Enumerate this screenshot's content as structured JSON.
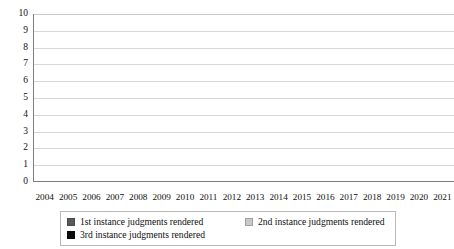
{
  "chart_data": {
    "type": "bar",
    "stacked": true,
    "title": "",
    "subtitle": "",
    "xlabel": "",
    "ylabel": "",
    "categories": [
      "2004",
      "2005",
      "2006",
      "2007",
      "2008",
      "2009",
      "2010",
      "2011",
      "2012",
      "2013",
      "2014",
      "2015",
      "2016",
      "2017",
      "2018",
      "2019",
      "2020",
      "2021"
    ],
    "series": [
      {
        "name": "1st instance judgments rendered",
        "color": "#595959",
        "values": [
          0,
          2,
          1,
          1,
          4,
          3,
          1,
          1,
          0,
          1,
          2,
          2,
          1,
          1,
          0,
          0,
          2,
          0
        ]
      },
      {
        "name": "2nd instance judgments rendered",
        "color": "#c7c7c7",
        "values": [
          0,
          0,
          0,
          0,
          0,
          0,
          1,
          1,
          0,
          0,
          1,
          0,
          1,
          0,
          0,
          1,
          1,
          0
        ]
      },
      {
        "name": "3rd instance judgments rendered",
        "color": "#0d0d0d",
        "values": [
          0,
          0,
          0,
          0,
          0,
          0,
          0,
          0,
          0,
          0,
          0,
          1,
          0,
          0,
          0,
          1,
          1,
          0
        ]
      }
    ],
    "totals": [
      0,
      2,
      1,
      1,
      4,
      3,
      2,
      2,
      0,
      1,
      3,
      3,
      2,
      1,
      0,
      2,
      4,
      0
    ],
    "ylim": [
      0,
      10
    ],
    "y_ticks": [
      "0",
      "1",
      "2",
      "3",
      "4",
      "5",
      "6",
      "7",
      "8",
      "9",
      "10"
    ],
    "grid": true,
    "legend_position": "bottom"
  },
  "axes": {
    "y_tick_labels": [
      "0",
      "1",
      "2",
      "3",
      "4",
      "5",
      "6",
      "7",
      "8",
      "9",
      "10"
    ],
    "x_tick_labels": [
      "2004",
      "2005",
      "2006",
      "2007",
      "2008",
      "2009",
      "2010",
      "2011",
      "2012",
      "2013",
      "2014",
      "2015",
      "2016",
      "2017",
      "2018",
      "2019",
      "2020",
      "2021"
    ]
  },
  "legend": {
    "items": [
      {
        "label": "1st instance judgments rendered",
        "color": "#595959"
      },
      {
        "label": "2nd instance judgments rendered",
        "color": "#c7c7c7"
      },
      {
        "label": "3rd instance judgments rendered",
        "color": "#0d0d0d"
      }
    ]
  }
}
